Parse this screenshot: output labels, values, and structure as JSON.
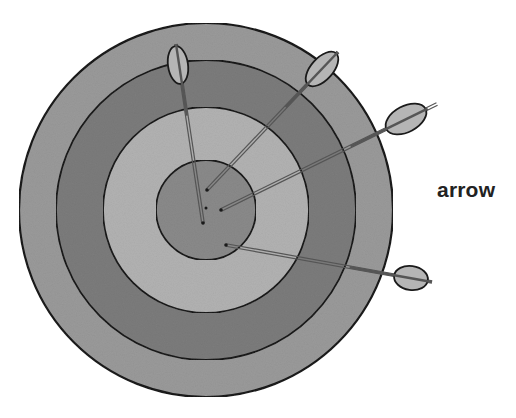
{
  "diagram": {
    "label": {
      "text": "arrow",
      "x": 437,
      "y": 178
    },
    "target": {
      "center": [
        206,
        210
      ],
      "rings": [
        {
          "name": "outer-ring",
          "radius": 187,
          "fill": "#9a9a9a"
        },
        {
          "name": "second-ring",
          "radius": 150,
          "fill": "#7c7c7c"
        },
        {
          "name": "third-ring",
          "radius": 103,
          "fill": "#b2b2b2"
        },
        {
          "name": "bullseye",
          "radius": 50,
          "fill": "#8a8a8a"
        }
      ],
      "stroke": "#1a1a1a"
    },
    "arrows": [
      {
        "name": "arrow-top",
        "tip": [
          203,
          223
        ],
        "tail": [
          176,
          44
        ],
        "fletch": [
          178,
          65
        ],
        "fletch_rx": 10,
        "fletch_ry": 19,
        "fletch_angle": -8
      },
      {
        "name": "arrow-upper-right",
        "tip": [
          207,
          190
        ],
        "tail": [
          338,
          52
        ],
        "fletch": [
          322,
          69
        ],
        "fletch_rx": 21,
        "fletch_ry": 11,
        "fletch_angle": -48
      },
      {
        "name": "arrow-right",
        "tip": [
          221,
          210
        ],
        "tail": [
          437,
          104
        ],
        "fletch": [
          406,
          119
        ],
        "fletch_rx": 22,
        "fletch_ry": 13,
        "fletch_angle": -28
      },
      {
        "name": "arrow-lower-right",
        "tip": [
          226,
          245
        ],
        "tail": [
          432,
          282
        ],
        "fletch": [
          411,
          278
        ],
        "fletch_rx": 17,
        "fletch_ry": 12,
        "fletch_angle": 8
      }
    ],
    "colors": {
      "background": "#ffffff",
      "ink": "#1a1a1a",
      "shaft": "#555555",
      "fletching": "#b5b5b5",
      "label": "#222222"
    }
  }
}
